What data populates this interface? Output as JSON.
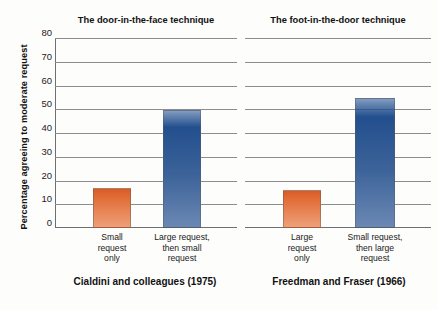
{
  "chart_data": {
    "type": "bar",
    "title": "",
    "xlabel": "",
    "ylabel": "Percentage agreeing to moderate request",
    "ylim": [
      0,
      80
    ],
    "yticks": [
      0,
      10,
      20,
      30,
      40,
      50,
      60,
      70,
      80
    ],
    "grid": true,
    "legend": "none",
    "panels": [
      {
        "title": "The door-in-the-face technique",
        "caption": "Cialdini and colleagues (1975)",
        "categories": [
          [
            "Small",
            "request",
            "only"
          ],
          [
            "Large request,",
            "then small",
            "request"
          ]
        ],
        "category_text": [
          "Small request only",
          "Large request, then small request"
        ],
        "values": [
          17,
          50
        ],
        "colors": [
          "#e0702f",
          "#2a5490"
        ]
      },
      {
        "title": "The foot-in-the-door technique",
        "caption": "Freedman and Fraser (1966)",
        "categories": [
          [
            "Large",
            "request",
            "only"
          ],
          [
            "Small request,",
            "then large",
            "request"
          ]
        ],
        "category_text": [
          "Large request only",
          "Small request, then large request"
        ],
        "values": [
          16,
          55
        ],
        "colors": [
          "#e0702f",
          "#2a5490"
        ]
      }
    ]
  },
  "colors": {
    "orange_bar": "#e0702f",
    "blue_bar": "#2a5490",
    "gridline": "#8c8c8c",
    "axis": "#6f6f6f",
    "text": "#1a1a1a",
    "background": "#fdfdfc"
  },
  "axis": {
    "y_title": "Percentage agreeing to moderate request",
    "tick_0": "0",
    "tick_10": "10",
    "tick_20": "20",
    "tick_30": "30",
    "tick_40": "40",
    "tick_50": "50",
    "tick_60": "60",
    "tick_70": "70",
    "tick_80": "80"
  },
  "left_panel": {
    "title": "The door-in-the-face technique",
    "caption": "Cialdini and colleagues (1975)",
    "cat1_line1": "Small",
    "cat1_line2": "request",
    "cat1_line3": "only",
    "cat2_line1": "Large request,",
    "cat2_line2": "then small",
    "cat2_line3": "request"
  },
  "right_panel": {
    "title": "The foot-in-the-door technique",
    "caption": "Freedman and Fraser (1966)",
    "cat1_line1": "Large",
    "cat1_line2": "request",
    "cat1_line3": "only",
    "cat2_line1": "Small request,",
    "cat2_line2": "then large",
    "cat2_line3": "request"
  }
}
